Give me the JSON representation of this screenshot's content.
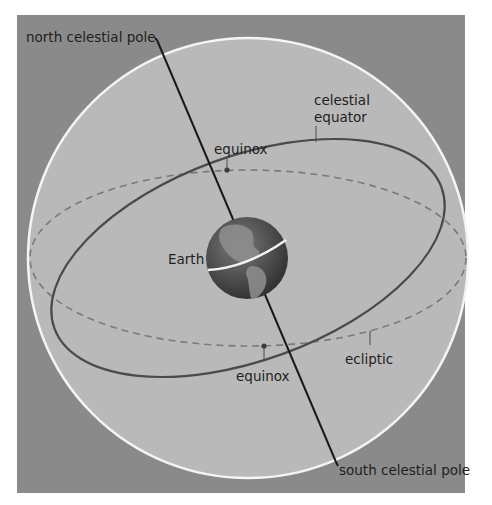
{
  "diagram": {
    "type": "celestial-sphere",
    "colors": {
      "page_background": "#ffffff",
      "frame_background": "#8a8a8a",
      "sphere_fill": "#b9b9b9",
      "sphere_outline": "#f4f4f4",
      "equator_line": "#4a4a4a",
      "ecliptic_line": "#7a7a7a",
      "axis_line": "#1a1a1a",
      "earth_dark": "#3f3f3f",
      "earth_light": "#8c8c8c",
      "text": "#1e1e1e"
    },
    "labels": {
      "north_pole": "north celestial pole",
      "south_pole": "south celestial pole",
      "celestial_equator_line1": "celestial",
      "celestial_equator_line2": "equator",
      "equinox_upper": "equinox",
      "equinox_lower": "equinox",
      "earth": "Earth",
      "ecliptic": "ecliptic"
    }
  }
}
